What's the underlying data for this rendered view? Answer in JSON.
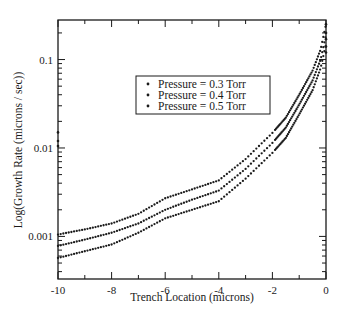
{
  "chart_data": {
    "type": "scatter",
    "title": "",
    "xlabel": "Trench Location (microns)",
    "ylabel": "Log(Growth Rate (microns / sec))",
    "xlim": [
      -10,
      0
    ],
    "ylim": [
      0.00033,
      0.28
    ],
    "yscale": "log",
    "x_ticks": [
      -10,
      -8,
      -6,
      -4,
      -2,
      0
    ],
    "x_tick_labels": [
      "-10",
      "-8",
      "-6",
      "-4",
      "-2",
      "0"
    ],
    "y_ticks": [
      0.001,
      0.01,
      0.1
    ],
    "y_tick_labels": [
      "0.001",
      "0.01",
      "0.1"
    ],
    "grid": false,
    "legend_position": "upper-center",
    "x": [
      -10,
      -9,
      -8,
      -7,
      -6,
      -5,
      -4,
      -3,
      -2,
      -1.5,
      -1,
      -0.5,
      -0.2,
      0
    ],
    "series": [
      {
        "name": "Pressure = 0.3 Torr",
        "marker": "dot",
        "color": "#1a1a1a",
        "values": [
          0.00105,
          0.0012,
          0.0014,
          0.0018,
          0.0027,
          0.0034,
          0.0043,
          0.0075,
          0.0148,
          0.022,
          0.04,
          0.075,
          0.13,
          0.25
        ]
      },
      {
        "name": "Pressure = 0.4 Torr",
        "marker": "dot",
        "color": "#1a1a1a",
        "values": [
          0.00078,
          0.00092,
          0.0011,
          0.0014,
          0.002,
          0.0026,
          0.0033,
          0.0058,
          0.0114,
          0.017,
          0.031,
          0.058,
          0.1,
          0.19
        ]
      },
      {
        "name": "Pressure = 0.5 Torr",
        "marker": "dot",
        "color": "#1a1a1a",
        "values": [
          0.00057,
          0.00068,
          0.00081,
          0.0011,
          0.0016,
          0.002,
          0.0025,
          0.0045,
          0.0088,
          0.013,
          0.024,
          0.045,
          0.08,
          0.15
        ]
      }
    ]
  },
  "legend": {
    "items": [
      "Pressure = 0.3 Torr",
      "Pressure = 0.4 Torr",
      "Pressure = 0.5 Torr"
    ]
  },
  "axes": {
    "xlabel": "Trench Location (microns)",
    "ylabel": "Log(Growth Rate (microns / sec))"
  },
  "colors": {
    "ink": "#1a1a1a",
    "background": "#ffffff"
  }
}
